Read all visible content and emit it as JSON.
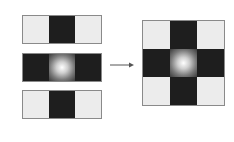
{
  "diagram": {
    "inputs": [
      {
        "cells": [
          "light",
          "dark",
          "light"
        ]
      },
      {
        "cells": [
          "dark",
          "glow",
          "dark"
        ]
      },
      {
        "cells": [
          "light",
          "dark",
          "light"
        ]
      }
    ],
    "arrow": {
      "direction": "right"
    },
    "output": {
      "rows": [
        [
          "light",
          "dark",
          "light"
        ],
        [
          "dark",
          "glow",
          "dark"
        ],
        [
          "light",
          "dark",
          "light"
        ]
      ]
    },
    "colors": {
      "light": "#ececec",
      "dark": "#1e1e1e",
      "border": "#8a8a8a"
    }
  }
}
